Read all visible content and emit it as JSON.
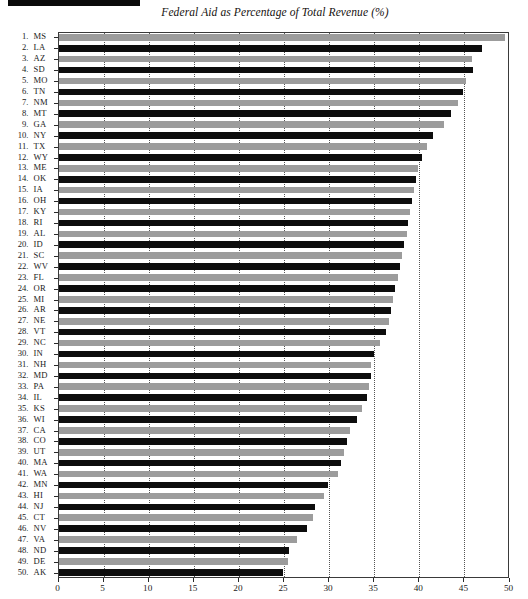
{
  "chart_data": {
    "type": "bar",
    "orientation": "horizontal",
    "title": "Federal Aid as Percentage of Total Revenue (%)",
    "xlabel": "",
    "ylabel": "",
    "xlim": [
      0,
      50
    ],
    "xticks": [
      0,
      5,
      10,
      15,
      20,
      25,
      30,
      35,
      40,
      45,
      50
    ],
    "xtick_labels": [
      "0",
      "5",
      "10",
      "15",
      "20",
      "25",
      "30",
      "35",
      "40",
      "45",
      "50"
    ],
    "grid": true,
    "grid_style": "dotted-vertical",
    "legend": "none",
    "bar_colors": [
      "#9c9c9c",
      "#0d0d0d"
    ],
    "bar_color_note": "bars alternate gray and black by rank",
    "ranks": [
      1,
      2,
      3,
      4,
      5,
      6,
      7,
      8,
      9,
      10,
      11,
      12,
      13,
      14,
      15,
      16,
      17,
      18,
      19,
      20,
      21,
      22,
      23,
      24,
      25,
      26,
      27,
      28,
      29,
      30,
      31,
      32,
      33,
      34,
      35,
      36,
      37,
      38,
      39,
      40,
      41,
      42,
      43,
      44,
      45,
      46,
      47,
      48,
      49,
      50
    ],
    "categories": [
      "MS",
      "LA",
      "AZ",
      "SD",
      "MO",
      "TN",
      "NM",
      "MT",
      "GA",
      "NY",
      "TX",
      "WY",
      "ME",
      "OK",
      "IA",
      "OH",
      "KY",
      "RI",
      "AL",
      "ID",
      "SC",
      "WV",
      "FL",
      "OR",
      "MI",
      "AR",
      "NE",
      "VT",
      "NC",
      "IN",
      "NH",
      "MD",
      "PA",
      "IL",
      "KS",
      "WI",
      "CA",
      "CO",
      "UT",
      "MA",
      "WA",
      "MN",
      "HI",
      "NJ",
      "CT",
      "NV",
      "VA",
      "ND",
      "DE",
      "AK"
    ],
    "values": [
      49.5,
      47.0,
      45.8,
      46.0,
      45.2,
      44.8,
      44.3,
      43.5,
      42.7,
      41.5,
      40.8,
      40.3,
      39.9,
      39.6,
      39.4,
      39.2,
      39.0,
      38.8,
      38.6,
      38.3,
      38.1,
      37.9,
      37.6,
      37.3,
      37.1,
      36.9,
      36.6,
      36.3,
      35.6,
      35.0,
      34.7,
      34.6,
      34.4,
      34.2,
      33.6,
      33.1,
      32.3,
      32.0,
      31.6,
      31.3,
      31.0,
      29.9,
      29.4,
      28.4,
      28.2,
      27.5,
      26.4,
      25.6,
      25.4,
      24.9
    ]
  },
  "axis": {
    "x_tick_labels": [
      "0",
      "5",
      "10",
      "15",
      "20",
      "25",
      "30",
      "35",
      "40",
      "45",
      "50"
    ]
  },
  "decor": {
    "top_rule": ""
  }
}
